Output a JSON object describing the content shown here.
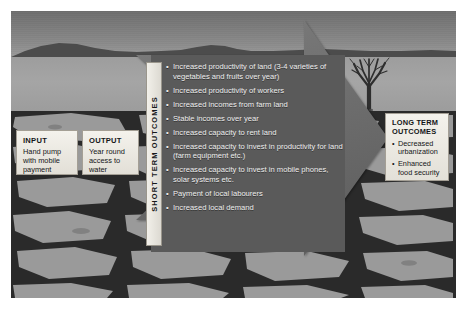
{
  "diagram": {
    "input_box": {
      "title": "INPUT",
      "detail": "Hand pump with mobile payment"
    },
    "output_box": {
      "title": "OUTPUT",
      "detail": "Year round access to water"
    },
    "short_term": {
      "label": "SHORT TERM OUTCOMES",
      "items": [
        "Increased productivity of land (3-4 varieties of vegetables and fruits over year)",
        "Increased productivity of workers",
        "Increased incomes from farm land",
        "Stable incomes over year",
        "Increased capacity to rent land",
        "Increased capacity to invest in productivity for land (farm equipment etc.)",
        "Increased capacity to invest in mobile phones, solar systems etc.",
        "Payment of local labourers",
        "Increased local demand"
      ]
    },
    "long_term": {
      "title": "LONG TERM OUTCOMES",
      "items": [
        "Decreased urbanization",
        "Enhanced food security"
      ]
    },
    "scene": {
      "tree": "bare-dead-tree",
      "ground": "cracked-dry-earth",
      "horizon": "distant-hills"
    },
    "colors": {
      "arrow": "#6f6f6f",
      "panel": "#5a5a5a",
      "box": "#f1efe9",
      "text_light": "#efefef",
      "text_dark": "#141618"
    }
  }
}
